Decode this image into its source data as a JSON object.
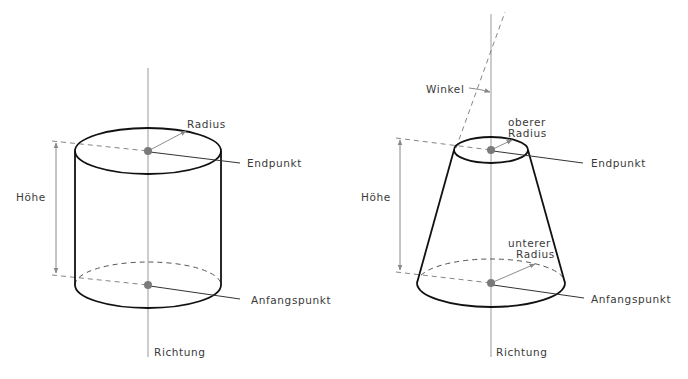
{
  "figure": {
    "cylinder": {
      "labels": {
        "radius": "Radius",
        "end_point": "Endpunkt",
        "start_point": "Anfangspunkt",
        "height": "Höhe",
        "direction": "Richtung"
      }
    },
    "cone": {
      "labels": {
        "angle": "Winkel",
        "upper_radius_line1": "oberer",
        "upper_radius_line2": "Radius",
        "lower_radius_line1": "unterer",
        "lower_radius_line2": "Radius",
        "end_point": "Endpunkt",
        "start_point": "Anfangspunkt",
        "height": "Höhe",
        "direction": "Richtung"
      }
    },
    "colors": {
      "outline": "#111111",
      "axis": "#9a9a9a",
      "point": "#7a7a7a",
      "text": "#3a3a3a",
      "background": "#ffffff"
    }
  }
}
